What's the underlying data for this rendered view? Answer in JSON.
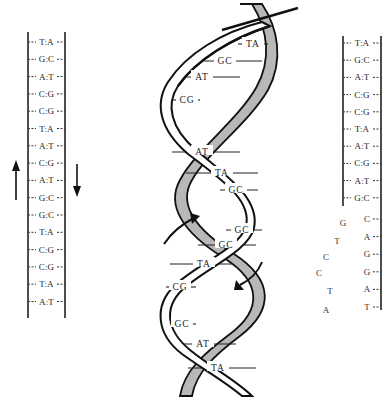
{
  "diagram": {
    "type": "dna-replication",
    "left_duplex": {
      "pairs": [
        "T:A",
        "G:C",
        "A:T",
        "C:G",
        "C:G",
        "T:A",
        "A:T",
        "C:G",
        "A:T",
        "G:C",
        "G:C",
        "T:A",
        "C:G",
        "C:G",
        "T:A",
        "A:T"
      ],
      "arrows": [
        {
          "direction": "up",
          "side": "left"
        },
        {
          "direction": "down",
          "side": "right"
        }
      ]
    },
    "helix": {
      "base_pairs": [
        "TA",
        "GC",
        "AT",
        "CG",
        "AT",
        "TA",
        "GC",
        "GC",
        "GC",
        "TA",
        "CG",
        "GC",
        "AT",
        "TA"
      ],
      "arrows": [
        {
          "direction": "up-right",
          "position": "left"
        },
        {
          "direction": "down-left",
          "position": "right"
        }
      ],
      "colors": {
        "strand_outline": "#111111",
        "ribbon_fill": "#b8b8b8"
      }
    },
    "right_duplex": {
      "paired": [
        "T:A",
        "G:C",
        "A:T",
        "C:G",
        "C:G",
        "T:A",
        "A:T",
        "C:G",
        "A:T",
        "G:C"
      ],
      "single_strand": [
        "C",
        "A",
        "G",
        "G",
        "A",
        "T"
      ],
      "separated_bases": [
        "G",
        "T",
        "C",
        "C",
        "T",
        "A"
      ]
    }
  }
}
